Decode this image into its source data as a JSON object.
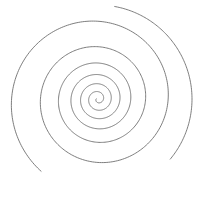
{
  "figure": {
    "type": "spiral-line-drawing",
    "width": 201,
    "height": 202,
    "background": "#ffffff",
    "stroke_color": "#6e6e6e",
    "stroke_width": 0.9,
    "spiral": {
      "center": [
        98,
        99
      ],
      "start_radius": 1.5,
      "end_radius": 92,
      "turns": 6.2,
      "growth": "exponential",
      "start_angle_deg": 200,
      "direction": "counterclockwise-outward",
      "ellipse_x_scale": 1.0,
      "ellipse_y_scale": 1.0
    },
    "outer_overlap_arc": {
      "description": "outermost ring slightly overlaps/doubles near top-right and bottom-right",
      "radius": 94,
      "from_deg": -80,
      "to_deg": 40
    }
  }
}
